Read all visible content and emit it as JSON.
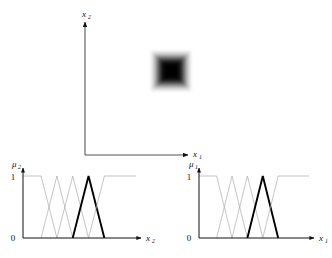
{
  "figure": {
    "type": "fuzzy-partition-diagram",
    "background_color": "#ffffff",
    "line_color_primary": "#111111",
    "line_color_secondary": "#aaaaaa",
    "highlight_color": "#000000"
  },
  "main_plot": {
    "name": "input-space-plot",
    "x_axis_label": "x",
    "x_axis_subscript": "1",
    "y_axis_label": "x",
    "y_axis_subscript": "2",
    "origin": {
      "x": 85,
      "y": 155
    },
    "x_axis_end": {
      "x": 191,
      "y": 155
    },
    "y_axis_end": {
      "x": 85,
      "y": 20
    },
    "fuzzy_region": {
      "name": "blurred-square-region",
      "center_x": 171,
      "center_y": 71,
      "outer_size": 40,
      "rings": [
        {
          "size": 40,
          "opacity": 0.1
        },
        {
          "size": 35,
          "opacity": 0.18
        },
        {
          "size": 30,
          "opacity": 0.3
        },
        {
          "size": 25,
          "opacity": 0.48
        },
        {
          "size": 20,
          "opacity": 0.7
        },
        {
          "size": 15,
          "opacity": 0.9
        },
        {
          "size": 10,
          "opacity": 1.0
        },
        {
          "size": 5,
          "opacity": 0.05
        }
      ]
    }
  },
  "chart_data": [
    {
      "type": "line",
      "name": "mu2-membership-chart",
      "title": "",
      "xlabel": "x",
      "xlabel_subscript": "2",
      "ylabel": "μ",
      "ylabel_subscript": "2",
      "ytick_labels": [
        "0",
        "1"
      ],
      "ylim": [
        0,
        1
      ],
      "xlim": [
        0,
        10
      ],
      "grid": false,
      "legend": false,
      "series": [
        {
          "name": "set-1",
          "highlight": false,
          "shape": "trapezoid-left",
          "points": [
            [
              0,
              1
            ],
            [
              1.6,
              1
            ],
            [
              3.0,
              0
            ]
          ]
        },
        {
          "name": "set-2",
          "highlight": false,
          "shape": "triangle",
          "points": [
            [
              1.6,
              0
            ],
            [
              3.0,
              1
            ],
            [
              4.4,
              0
            ]
          ]
        },
        {
          "name": "set-3",
          "highlight": false,
          "shape": "triangle",
          "points": [
            [
              3.0,
              0
            ],
            [
              4.4,
              1
            ],
            [
              5.8,
              0
            ]
          ]
        },
        {
          "name": "set-4",
          "highlight": true,
          "shape": "triangle",
          "points": [
            [
              4.4,
              0
            ],
            [
              5.8,
              1
            ],
            [
              7.2,
              0
            ]
          ]
        },
        {
          "name": "set-5",
          "highlight": false,
          "shape": "trapezoid-right",
          "points": [
            [
              5.8,
              0
            ],
            [
              7.2,
              1
            ],
            [
              10,
              1
            ]
          ]
        }
      ]
    },
    {
      "type": "line",
      "name": "mu1-membership-chart",
      "title": "",
      "xlabel": "x",
      "xlabel_subscript": "1",
      "ylabel": "μ",
      "ylabel_subscript": "1",
      "ytick_labels": [
        "0",
        "1"
      ],
      "ylim": [
        0,
        1
      ],
      "xlim": [
        0,
        10
      ],
      "grid": false,
      "legend": false,
      "series": [
        {
          "name": "set-1",
          "highlight": false,
          "shape": "trapezoid-left",
          "points": [
            [
              0,
              1
            ],
            [
              1.6,
              1
            ],
            [
              3.0,
              0
            ]
          ]
        },
        {
          "name": "set-2",
          "highlight": false,
          "shape": "triangle",
          "points": [
            [
              1.6,
              0
            ],
            [
              3.0,
              1
            ],
            [
              4.4,
              0
            ]
          ]
        },
        {
          "name": "set-3",
          "highlight": false,
          "shape": "triangle",
          "points": [
            [
              3.0,
              0
            ],
            [
              4.4,
              1
            ],
            [
              5.8,
              0
            ]
          ]
        },
        {
          "name": "set-4",
          "highlight": true,
          "shape": "triangle",
          "points": [
            [
              4.4,
              0
            ],
            [
              5.8,
              1
            ],
            [
              7.2,
              0
            ]
          ]
        },
        {
          "name": "set-5",
          "highlight": false,
          "shape": "trapezoid-right",
          "points": [
            [
              5.8,
              0
            ],
            [
              7.2,
              1
            ],
            [
              10,
              1
            ]
          ]
        }
      ]
    }
  ],
  "labels": {
    "main_x": "x",
    "main_x_sub": "1",
    "main_y": "x",
    "main_y_sub": "2",
    "left_mu": "μ",
    "left_mu_sub": "2",
    "left_x": "x",
    "left_x_sub": "2",
    "left_tick_one": "1",
    "left_tick_zero": "0",
    "right_mu": "μ",
    "right_mu_sub": "1",
    "right_x": "x",
    "right_x_sub": "1",
    "right_tick_one": "1",
    "right_tick_zero": "0"
  }
}
